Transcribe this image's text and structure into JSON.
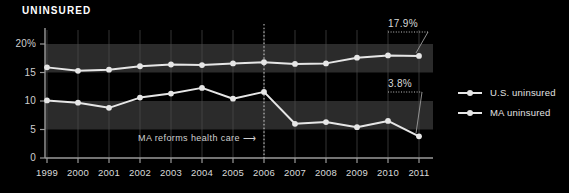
{
  "title": "UNINSURED",
  "colors": {
    "background": "#000000",
    "band": "#2b2b2b",
    "series": "#e6e6e6",
    "axis": "#9a9a9a",
    "grid": "#4a4a4a",
    "text": "#e0e0e0"
  },
  "event": {
    "label": "MA reforms health care",
    "arrow": "⟶",
    "year": "2006"
  },
  "annotations": [
    {
      "name": "us-2011-callout",
      "text": "17.9%",
      "year": "2011",
      "value": 17.9
    },
    {
      "name": "ma-2011-callout",
      "text": "3.8%",
      "year": "2011",
      "value": 3.8
    }
  ],
  "legend": {
    "position": "right",
    "items": [
      {
        "label": "U.S. uninsured",
        "color": "#e6e6e6"
      },
      {
        "label": "MA uninsured",
        "color": "#e6e6e6"
      }
    ]
  },
  "chart_data": {
    "type": "line",
    "title": "UNINSURED",
    "xlabel": "",
    "ylabel": "",
    "ylim": [
      0,
      22
    ],
    "yticks": [
      0,
      5,
      10,
      15,
      20
    ],
    "ytick_labels": [
      "0",
      "5",
      "10",
      "15",
      "20%"
    ],
    "grid": true,
    "categories": [
      "1999",
      "2000",
      "2001",
      "2002",
      "2003",
      "2004",
      "2005",
      "2006",
      "2007",
      "2008",
      "2009",
      "2010",
      "2011"
    ],
    "series": [
      {
        "name": "U.S. uninsured",
        "values": [
          15.9,
          15.3,
          15.5,
          16.1,
          16.4,
          16.3,
          16.6,
          16.8,
          16.5,
          16.6,
          17.6,
          18.0,
          17.9
        ]
      },
      {
        "name": "MA uninsured",
        "values": [
          10.1,
          9.7,
          8.8,
          10.6,
          11.3,
          12.3,
          10.4,
          11.6,
          6.0,
          6.3,
          5.4,
          6.5,
          3.8
        ]
      }
    ],
    "bands": [
      [
        15,
        20
      ],
      [
        5,
        10
      ]
    ],
    "vline": {
      "at": "2006",
      "style": "dotted"
    }
  }
}
